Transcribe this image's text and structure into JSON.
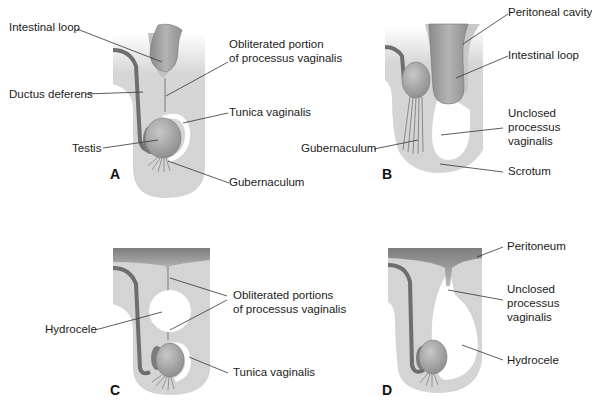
{
  "panels": {
    "A": {
      "letter": "A",
      "labels": {
        "intestinal_loop": "Intestinal loop",
        "obliterated_1": "Obliterated portion",
        "obliterated_2": "of processus vaginalis",
        "ductus_deferens": "Ductus deferens",
        "tunica_vaginalis": "Tunica vaginalis",
        "testis": "Testis",
        "gubernaculum": "Gubernaculum"
      }
    },
    "B": {
      "letter": "B",
      "labels": {
        "peritoneal_cavity": "Peritoneal cavity",
        "intestinal_loop": "Intestinal loop",
        "unclosed_1": "Unclosed",
        "unclosed_2": "processus",
        "unclosed_3": "vaginalis",
        "gubernaculum": "Gubernaculum",
        "scrotum": "Scrotum"
      }
    },
    "C": {
      "letter": "C",
      "labels": {
        "hydrocele": "Hydrocele",
        "obliterated_1": "Obliterated portions",
        "obliterated_2": "of processus vaginalis",
        "tunica_vaginalis": "Tunica vaginalis"
      }
    },
    "D": {
      "letter": "D",
      "labels": {
        "peritoneum": "Peritoneum",
        "unclosed_1": "Unclosed",
        "unclosed_2": "processus",
        "unclosed_3": "vaginalis",
        "hydrocele": "Hydrocele"
      }
    }
  },
  "colors": {
    "tissue": "#d4d4d4",
    "tissue_dark": "#9c9c9c",
    "testis": "#a9a9a9",
    "duct": "#6e6e6e",
    "cavity": "#ffffff",
    "leader": "#333333"
  }
}
